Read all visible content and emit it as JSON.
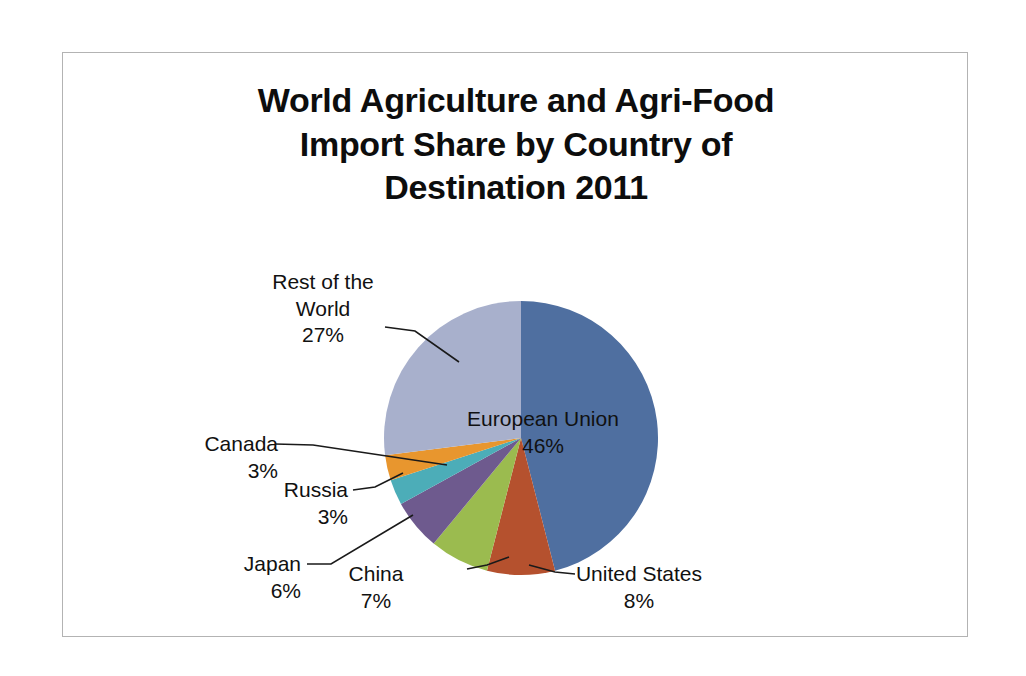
{
  "chart_data": {
    "type": "pie",
    "title": "World Agriculture and Agri-Food\nImport Share by Country of\nDestination 2011",
    "xlabel": "",
    "ylabel": "",
    "legend": "none",
    "grid": false,
    "units": "percent",
    "categories": [
      "European Union",
      "United States",
      "China",
      "Japan",
      "Russia",
      "Canada",
      "Rest of the World"
    ],
    "values": [
      46,
      8,
      7,
      6,
      3,
      3,
      27
    ],
    "colors": [
      "#4f6fa0",
      "#b5512e",
      "#9bbb4f",
      "#6e5a8e",
      "#4cadb8",
      "#e8962e",
      "#a8b0cc"
    ],
    "start_angle_deg": 0,
    "direction": "clockwise",
    "slices": [
      {
        "name": "European Union",
        "value": 46,
        "label": "European Union\n46%",
        "percent_label": "46%",
        "color": "#4f6fa0",
        "label_placement": "inside"
      },
      {
        "name": "United States",
        "value": 8,
        "label": "United States\n8%",
        "percent_label": "8%",
        "color": "#b5512e",
        "label_placement": "outside"
      },
      {
        "name": "China",
        "value": 7,
        "label": "China\n7%",
        "percent_label": "7%",
        "color": "#9bbb4f",
        "label_placement": "outside"
      },
      {
        "name": "Japan",
        "value": 6,
        "label": "Japan\n6%",
        "percent_label": "6%",
        "color": "#6e5a8e",
        "label_placement": "outside"
      },
      {
        "name": "Russia",
        "value": 3,
        "label": "Russia\n3%",
        "percent_label": "3%",
        "color": "#4cadb8",
        "label_placement": "outside"
      },
      {
        "name": "Canada",
        "value": 3,
        "label": "Canada\n3%",
        "percent_label": "3%",
        "color": "#e8962e",
        "label_placement": "outside"
      },
      {
        "name": "Rest of the World",
        "value": 27,
        "label": "Rest of the\nWorld\n27%",
        "percent_label": "27%",
        "color": "#a8b0cc",
        "label_placement": "outside"
      }
    ]
  },
  "labels": {
    "european_union": "European Union\n46%",
    "united_states": "United States\n8%",
    "china": "China\n7%",
    "japan": "Japan\n6%",
    "russia": "Russia\n3%",
    "canada": "Canada\n3%",
    "rest_of_world": "Rest of the\nWorld\n27%"
  },
  "style": {
    "border_color": "#b3b3b3",
    "background": "#ffffff",
    "title_color": "#0d0d0d",
    "label_color": "#111111",
    "leader_line_color": "#1a1a1a"
  }
}
